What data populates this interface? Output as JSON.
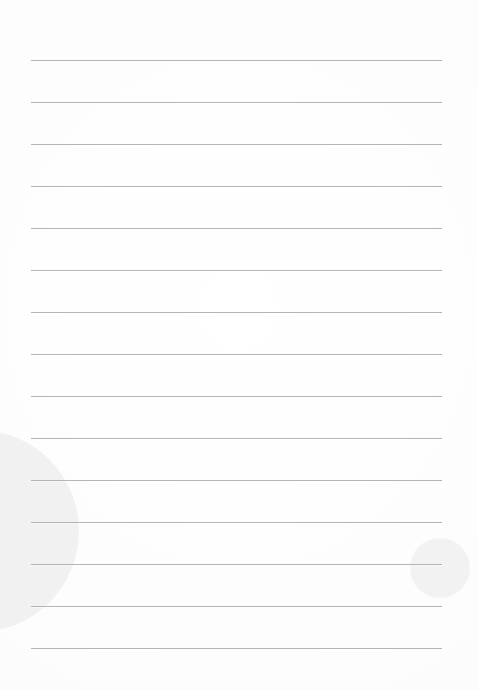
{
  "document": {
    "title": "Blank Lined Note Page",
    "page_number": "",
    "body_text": "",
    "background_color": "#fdfdfd"
  },
  "paper": {
    "width": 478,
    "height": 690,
    "surface_color": "#fdfdfd"
  },
  "ruling": {
    "line_color": "#a9a9ad",
    "line_count": 15,
    "line_spacing": 42,
    "first_line_y": 60,
    "left_margin": 31,
    "right_margin": 36,
    "lines": [
      {
        "y": 60
      },
      {
        "y": 102
      },
      {
        "y": 144
      },
      {
        "y": 186
      },
      {
        "y": 228
      },
      {
        "y": 270
      },
      {
        "y": 312
      },
      {
        "y": 354
      },
      {
        "y": 396
      },
      {
        "y": 438
      },
      {
        "y": 480
      },
      {
        "y": 522
      },
      {
        "y": 564
      },
      {
        "y": 606
      },
      {
        "y": 648
      }
    ]
  },
  "decorations": {
    "circles": [
      {
        "name": "large-left-circle",
        "color": "#f0f0f0",
        "cx": -22,
        "cy": 531,
        "r": 101
      },
      {
        "name": "small-right-circle",
        "color": "#f1f1f1",
        "cx": 440,
        "cy": 568,
        "r": 30
      }
    ]
  }
}
